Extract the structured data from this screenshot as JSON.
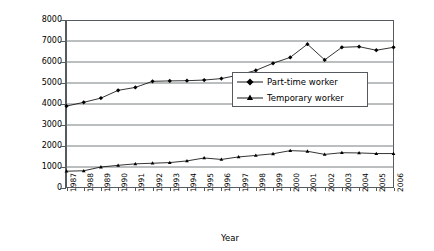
{
  "chart_data": {
    "type": "line",
    "title": "",
    "xlabel": "Year",
    "ylabel": "Number of workers (thousands)",
    "categories": [
      "1987",
      "1988",
      "1989",
      "1990",
      "1991",
      "1992",
      "1993",
      "1994",
      "1995",
      "1996",
      "1997",
      "1998",
      "1999",
      "2000",
      "2001",
      "2002",
      "2003",
      "2004",
      "2005",
      "2006"
    ],
    "xlim": [
      1987,
      2006
    ],
    "ylim": [
      0,
      8000
    ],
    "yticks": [
      0,
      1000,
      2000,
      3000,
      4000,
      5000,
      6000,
      7000,
      8000
    ],
    "ytick_labels": [
      "0",
      "1000",
      "2000",
      "3000",
      "4000",
      "5000",
      "6000",
      "7000",
      "8000"
    ],
    "grid": true,
    "grid_axis": "y",
    "legend_position": "center-right",
    "series": [
      {
        "name": "Part-time worker",
        "marker": "diamond",
        "color": "#000000",
        "values": [
          3900,
          4080,
          4280,
          4650,
          4790,
          5080,
          5100,
          5110,
          5140,
          5210,
          5380,
          5600,
          5940,
          6220,
          6850,
          6100,
          6700,
          6730,
          6560,
          6700
        ]
      },
      {
        "name": "Temporary worker",
        "marker": "triangle",
        "color": "#000000",
        "values": [
          800,
          820,
          1000,
          1080,
          1150,
          1180,
          1210,
          1290,
          1430,
          1360,
          1480,
          1550,
          1630,
          1780,
          1750,
          1600,
          1680,
          1670,
          1640,
          1640
        ]
      }
    ]
  },
  "legend": {
    "items": [
      {
        "label": "Part-time worker",
        "marker": "diamond"
      },
      {
        "label": "Temporary worker",
        "marker": "triangle"
      }
    ]
  },
  "axes": {
    "y_title": "Number of workers (thousands)",
    "x_title": "Year"
  }
}
